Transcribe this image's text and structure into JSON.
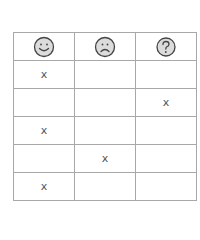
{
  "table": {
    "headers": [
      {
        "icon": "happy-face-icon",
        "label": ""
      },
      {
        "icon": "sad-face-icon",
        "label": ""
      },
      {
        "icon": "question-mark-icon",
        "label": ""
      }
    ],
    "rows": [
      [
        "x",
        "",
        ""
      ],
      [
        "",
        "",
        "x"
      ],
      [
        "x",
        "",
        ""
      ],
      [
        "",
        "x",
        ""
      ],
      [
        "x",
        "",
        ""
      ]
    ]
  },
  "colors": {
    "grid_line": "#a8a8a8",
    "icon_fill": "#dcdcdc",
    "icon_stroke": "#444444",
    "mark": "#555555"
  }
}
